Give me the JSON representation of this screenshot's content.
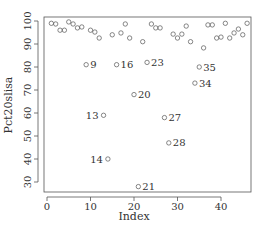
{
  "chart_data": {
    "type": "scatter",
    "title": "",
    "xlabel": "Index",
    "ylabel": "Pct20slisa",
    "xlim": [
      0,
      46
    ],
    "ylim": [
      27,
      101
    ],
    "xticks": [
      0,
      10,
      20,
      30,
      40
    ],
    "yticks": [
      30,
      40,
      50,
      60,
      70,
      80,
      90,
      100
    ],
    "grid": false,
    "legend": null,
    "marker": "open-circle",
    "colors": {
      "points": "#555555",
      "axis": "#555555",
      "text": "#333333"
    },
    "points": [
      {
        "x": 1,
        "y": 99.0
      },
      {
        "x": 2,
        "y": 98.7
      },
      {
        "x": 3,
        "y": 96.0
      },
      {
        "x": 4,
        "y": 96.0
      },
      {
        "x": 5,
        "y": 99.6
      },
      {
        "x": 6,
        "y": 98.7
      },
      {
        "x": 7,
        "y": 97.0
      },
      {
        "x": 8,
        "y": 97.4
      },
      {
        "x": 9,
        "y": 81.0,
        "label": "9"
      },
      {
        "x": 10,
        "y": 96.0
      },
      {
        "x": 11,
        "y": 95.2
      },
      {
        "x": 12,
        "y": 92.6
      },
      {
        "x": 13,
        "y": 59.0,
        "label": "13"
      },
      {
        "x": 14,
        "y": 40.0,
        "label": "14"
      },
      {
        "x": 15,
        "y": 94.0
      },
      {
        "x": 16,
        "y": 81.0,
        "label": "16"
      },
      {
        "x": 17,
        "y": 94.8
      },
      {
        "x": 18,
        "y": 98.7
      },
      {
        "x": 19,
        "y": 92.6
      },
      {
        "x": 20,
        "y": 68.0,
        "label": "20"
      },
      {
        "x": 21,
        "y": 28.0,
        "label": "21"
      },
      {
        "x": 22,
        "y": 91.0
      },
      {
        "x": 23,
        "y": 82.0,
        "label": "23"
      },
      {
        "x": 24,
        "y": 98.7
      },
      {
        "x": 25,
        "y": 97.0
      },
      {
        "x": 26,
        "y": 97.0
      },
      {
        "x": 27,
        "y": 58.0,
        "label": "27"
      },
      {
        "x": 28,
        "y": 47.0,
        "label": "28"
      },
      {
        "x": 29,
        "y": 94.3
      },
      {
        "x": 30,
        "y": 92.6
      },
      {
        "x": 31,
        "y": 94.3
      },
      {
        "x": 32,
        "y": 97.8
      },
      {
        "x": 33,
        "y": 91.0
      },
      {
        "x": 34,
        "y": 73.0,
        "label": "34"
      },
      {
        "x": 35,
        "y": 80.0,
        "label": "35"
      },
      {
        "x": 36,
        "y": 88.3
      },
      {
        "x": 37,
        "y": 98.3
      },
      {
        "x": 38,
        "y": 98.3
      },
      {
        "x": 39,
        "y": 92.6
      },
      {
        "x": 40,
        "y": 93.0
      },
      {
        "x": 41,
        "y": 99.0
      },
      {
        "x": 42,
        "y": 92.6
      },
      {
        "x": 43,
        "y": 94.8
      },
      {
        "x": 44,
        "y": 96.5
      },
      {
        "x": 45,
        "y": 94.0
      },
      {
        "x": 46,
        "y": 99.0
      }
    ]
  }
}
